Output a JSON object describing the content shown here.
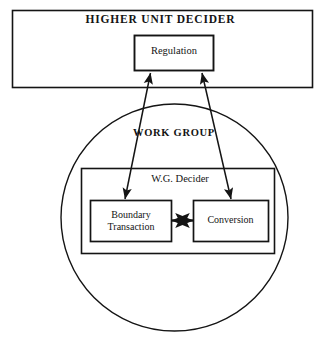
{
  "diagram": {
    "type": "block-diagram",
    "title_outer": "HIGHER UNIT DECIDER",
    "regulation": {
      "label": "Regulation"
    },
    "work_group": {
      "label": "WORK GROUP"
    },
    "wg_decider": {
      "label": "W.G. Decider"
    },
    "boundary_transaction": {
      "label": "Boundary\nTransaction",
      "line1": "Boundary",
      "line2": "Transaction"
    },
    "conversion": {
      "label": "Conversion"
    },
    "colors": {
      "stroke": "#141414",
      "background": "#ffffff",
      "text": "#141414"
    },
    "connectors": [
      {
        "name": "regulation-to-boundary-transaction",
        "kind": "double-headed-arrow"
      },
      {
        "name": "regulation-to-conversion",
        "kind": "double-headed-arrow"
      },
      {
        "name": "boundary-transaction-to-conversion",
        "kind": "double-headed-arrow"
      }
    ]
  }
}
